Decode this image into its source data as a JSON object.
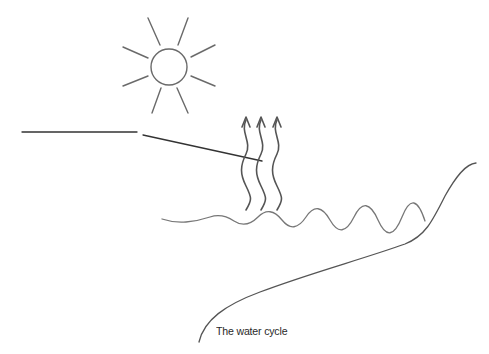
{
  "diagram": {
    "title": "The water cycle",
    "elements": {
      "sun": {
        "label": "sun",
        "icon": "sun-icon",
        "center": [
          169,
          67
        ],
        "radius": 18,
        "rays": 8
      },
      "label_line": {
        "label": "pointer-line",
        "horizontal": [
          [
            22,
            132
          ],
          [
            137,
            132
          ]
        ],
        "leader": [
          [
            143,
            135
          ],
          [
            262,
            161
          ]
        ]
      },
      "evaporation": {
        "label": "evaporation-arrows",
        "count": 3,
        "x": [
          246,
          261,
          277
        ],
        "top_y": 117,
        "bottom_y": 210
      },
      "water_surface": {
        "label": "water-surface-wave",
        "start": [
          162,
          219
        ],
        "end": [
          425,
          221
        ]
      },
      "land": {
        "label": "land-slope",
        "start": [
          199,
          342
        ],
        "end": [
          476,
          163
        ]
      }
    },
    "colors": {
      "stroke": "#555555",
      "sun_stroke": "#666666",
      "water_stroke": "#777777",
      "caption": "#2a2a2a",
      "background": "#ffffff"
    }
  }
}
